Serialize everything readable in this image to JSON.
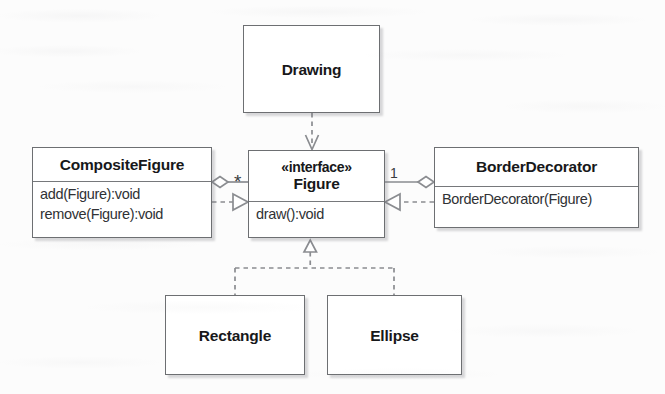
{
  "diagram": {
    "kind": "uml-class-diagram",
    "colors": {
      "background": "#fcfcfc",
      "box_fill": "#ffffff",
      "box_border": "#6d6f72",
      "line": "#8a8c90",
      "text": "#17181a",
      "member_text": "#303235"
    },
    "classes": [
      {
        "id": "drawing",
        "name": "Drawing",
        "stereotype": "",
        "members": [],
        "x": 243,
        "y": 25,
        "width": 137,
        "height": 88,
        "title_height": 88
      },
      {
        "id": "composite-figure",
        "name": "CompositeFigure",
        "stereotype": "",
        "members": [
          "add(Figure):void",
          "remove(Figure):void"
        ],
        "x": 32,
        "y": 147,
        "width": 180,
        "height": 91,
        "title_height": 33
      },
      {
        "id": "figure",
        "name": "Figure",
        "stereotype": "«interface»",
        "members": [
          "draw():void"
        ],
        "x": 248,
        "y": 150,
        "width": 137,
        "height": 88,
        "title_height": 50
      },
      {
        "id": "border-decorator",
        "name": "BorderDecorator",
        "stereotype": "",
        "members": [
          "BorderDecorator(Figure)"
        ],
        "x": 434,
        "y": 147,
        "width": 205,
        "height": 81,
        "title_height": 38
      },
      {
        "id": "rectangle",
        "name": "Rectangle",
        "stereotype": "",
        "members": [],
        "x": 165,
        "y": 295,
        "width": 140,
        "height": 80,
        "title_height": 80
      },
      {
        "id": "ellipse",
        "name": "Ellipse",
        "stereotype": "",
        "members": [],
        "x": 327,
        "y": 295,
        "width": 135,
        "height": 80,
        "title_height": 80
      }
    ],
    "relationships": [
      {
        "id": "drawing-uses-figure",
        "type": "dependency",
        "from": "drawing",
        "to": "figure",
        "style": "dashed",
        "arrowhead": "open",
        "label": ""
      },
      {
        "id": "composite-aggregates-figure",
        "type": "aggregation",
        "from": "composite-figure",
        "to": "figure",
        "style": "solid",
        "arrowhead": "hollow-diamond",
        "label": "*"
      },
      {
        "id": "composite-realizes-figure",
        "type": "realization",
        "from": "composite-figure",
        "to": "figure",
        "style": "dashed",
        "arrowhead": "hollow-triangle",
        "label": ""
      },
      {
        "id": "decorator-aggregates-figure",
        "type": "aggregation",
        "from": "border-decorator",
        "to": "figure",
        "style": "solid",
        "arrowhead": "hollow-diamond",
        "label": "1"
      },
      {
        "id": "decorator-realizes-figure",
        "type": "realization",
        "from": "border-decorator",
        "to": "figure",
        "style": "dashed",
        "arrowhead": "hollow-triangle",
        "label": ""
      },
      {
        "id": "rectangle-realizes-figure",
        "type": "realization",
        "from": "rectangle",
        "to": "figure",
        "style": "dashed",
        "arrowhead": "hollow-triangle",
        "label": ""
      },
      {
        "id": "ellipse-realizes-figure",
        "type": "realization",
        "from": "ellipse",
        "to": "figure",
        "style": "dashed",
        "arrowhead": "hollow-triangle",
        "label": ""
      }
    ],
    "multiplicities": {
      "composite_side": "*",
      "decorator_side": "1"
    }
  }
}
